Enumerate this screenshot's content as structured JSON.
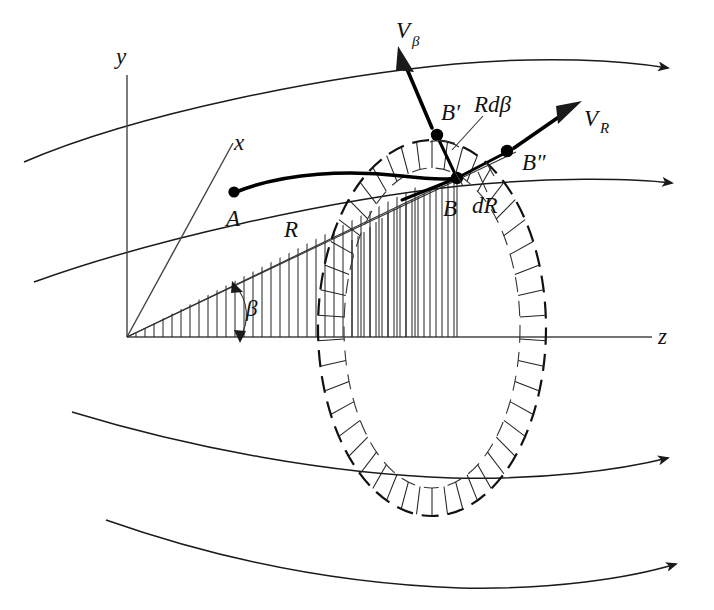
{
  "figure": {
    "background_color": "#ffffff",
    "ink_color": "#111111",
    "width": 714,
    "height": 610
  },
  "axes": {
    "y_label": "y",
    "x_label": "x",
    "z_label": "z",
    "origin_label": ""
  },
  "points": {
    "a_label": "A",
    "b_label": "B",
    "b_prime_label": "B′",
    "b_double_prime_label": "B″"
  },
  "vectors": {
    "v_beta_label": "V",
    "v_beta_sub": "β",
    "v_r_label": "V",
    "v_r_sub": "R"
  },
  "lengths": {
    "radius_label": "R",
    "arc_label": "Rdβ",
    "radial_increment_label": "dR",
    "angle_label": "β"
  },
  "streamlines": {
    "count": 4,
    "description": "four curved streamline arrows flowing left to right",
    "arrow_direction": "right"
  },
  "geometry": {
    "annulus_description": "hatched elliptical annular ring (vortex tube cross-section)",
    "wedge_description": "vertically hatched triangular wedge from origin subtending angle beta",
    "sector_description": "vertically hatched circular sector between radius R and R+dR"
  },
  "colors": {
    "ink": "#111111",
    "thin_ink": "#333333",
    "background": "#ffffff"
  }
}
